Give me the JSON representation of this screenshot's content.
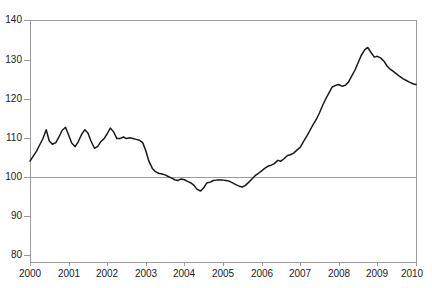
{
  "chart_data": {
    "type": "line",
    "title": "",
    "xlabel": "",
    "ylabel": "",
    "xlim": [
      2000,
      2010
    ],
    "ylim": [
      80,
      140
    ],
    "yticks": [
      80,
      90,
      100,
      110,
      120,
      130,
      140
    ],
    "xticks": [
      2000,
      2001,
      2002,
      2003,
      2004,
      2005,
      2006,
      2007,
      2008,
      2009,
      2010
    ],
    "grid": "horizontal-reference-line-at-100",
    "legend": "none",
    "reference_line": 100,
    "line_color": "#1a1a1a",
    "axis_color": "#9a9a9a",
    "series": [
      {
        "name": "Index",
        "x": [
          2000.0,
          2000.08,
          2000.17,
          2000.25,
          2000.33,
          2000.42,
          2000.5,
          2000.58,
          2000.67,
          2000.75,
          2000.83,
          2000.92,
          2001.0,
          2001.08,
          2001.17,
          2001.25,
          2001.33,
          2001.42,
          2001.5,
          2001.58,
          2001.67,
          2001.75,
          2001.83,
          2001.92,
          2002.0,
          2002.08,
          2002.17,
          2002.25,
          2002.33,
          2002.42,
          2002.5,
          2002.58,
          2002.67,
          2002.75,
          2002.83,
          2002.92,
          2003.0,
          2003.08,
          2003.17,
          2003.25,
          2003.33,
          2003.42,
          2003.5,
          2003.58,
          2003.67,
          2003.75,
          2003.83,
          2003.92,
          2004.0,
          2004.08,
          2004.17,
          2004.25,
          2004.33,
          2004.42,
          2004.5,
          2004.58,
          2004.67,
          2004.75,
          2004.83,
          2004.92,
          2005.0,
          2005.08,
          2005.17,
          2005.25,
          2005.33,
          2005.42,
          2005.5,
          2005.58,
          2005.67,
          2005.75,
          2005.83,
          2005.92,
          2006.0,
          2006.08,
          2006.17,
          2006.25,
          2006.33,
          2006.42,
          2006.5,
          2006.58,
          2006.67,
          2006.75,
          2006.83,
          2006.92,
          2007.0,
          2007.08,
          2007.17,
          2007.25,
          2007.33,
          2007.42,
          2007.5,
          2007.58,
          2007.67,
          2007.75,
          2007.83,
          2007.92,
          2008.0,
          2008.08,
          2008.17,
          2008.25,
          2008.33,
          2008.42,
          2008.5,
          2008.58,
          2008.67,
          2008.75,
          2008.83,
          2008.92,
          2009.0,
          2009.08,
          2009.17,
          2009.25,
          2009.33,
          2009.42,
          2009.5,
          2009.58,
          2009.67,
          2009.75,
          2009.83,
          2009.92,
          2010.0
        ],
        "values": [
          105.0,
          106.2,
          107.5,
          109.0,
          110.5,
          112.8,
          110.0,
          109.2,
          109.6,
          111.0,
          112.6,
          113.4,
          111.5,
          109.5,
          108.6,
          109.8,
          111.5,
          112.8,
          112.0,
          110.0,
          108.2,
          108.6,
          109.8,
          110.6,
          111.8,
          113.2,
          112.2,
          110.6,
          110.6,
          111.0,
          110.6,
          110.8,
          110.6,
          110.4,
          110.2,
          109.6,
          107.6,
          105.0,
          103.2,
          102.4,
          102.0,
          101.8,
          101.6,
          101.2,
          100.8,
          100.4,
          100.2,
          100.6,
          100.4,
          100.0,
          99.6,
          99.0,
          98.0,
          97.6,
          98.4,
          99.6,
          99.8,
          100.2,
          100.3,
          100.3,
          100.3,
          100.2,
          100.0,
          99.6,
          99.2,
          98.8,
          98.6,
          99.0,
          99.8,
          100.6,
          101.4,
          102.0,
          102.6,
          103.2,
          103.8,
          104.0,
          104.4,
          105.2,
          105.0,
          105.6,
          106.4,
          106.6,
          107.0,
          107.8,
          108.4,
          109.8,
          111.2,
          112.6,
          114.0,
          115.4,
          117.0,
          118.8,
          120.6,
          122.0,
          123.4,
          123.8,
          124.0,
          123.6,
          123.8,
          124.6,
          126.0,
          127.6,
          129.4,
          131.2,
          132.6,
          133.2,
          132.0,
          130.8,
          131.0,
          130.6,
          129.8,
          128.6,
          127.8,
          127.2,
          126.6,
          126.0,
          125.4,
          125.0,
          124.6,
          124.2,
          124.0
        ]
      }
    ]
  },
  "axis": {
    "y_labels": [
      "140",
      "130",
      "120",
      "110",
      "100",
      "90",
      "80"
    ],
    "x_labels": [
      "2000",
      "2001",
      "2002",
      "2003",
      "2004",
      "2005",
      "2006",
      "2007",
      "2008",
      "2009",
      "2010"
    ]
  },
  "title_text": ""
}
